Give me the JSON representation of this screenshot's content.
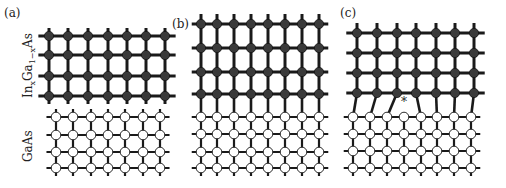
{
  "figure": {
    "panels": [
      {
        "id": "a",
        "label": "(a)"
      },
      {
        "id": "b",
        "label": "(b)"
      },
      {
        "id": "c",
        "label": "(c)"
      }
    ],
    "layer_labels": {
      "top": "InxGa1−xAs",
      "top_parts": {
        "base1": "In",
        "sub1": "x",
        "base2": "Ga",
        "sub2": "1−x",
        "base3": "As"
      },
      "bottom": "GaAs"
    },
    "defect_marker": "*",
    "colors": {
      "filled_atom": "#3a3a3a",
      "bond": "#1a1a1a",
      "open_atom_fill": "#ffffff",
      "open_atom_stroke": "#2a2a2a"
    },
    "lattices": {
      "a": {
        "top": {
          "xs": [
            49,
            68,
            88,
            108,
            127,
            146,
            165
          ],
          "ys": [
            36,
            55,
            76,
            96
          ]
        },
        "bottom": {
          "xs": [
            56,
            73,
            91,
            108,
            125,
            143,
            160
          ],
          "ys": [
            117,
            135,
            152,
            168
          ]
        }
      },
      "b": {
        "top": {
          "xs": [
            201,
            217,
            234,
            251,
            268,
            285,
            302,
            319
          ],
          "ys": [
            24,
            48,
            72,
            94
          ]
        },
        "bottom": {
          "xs": [
            201,
            217,
            234,
            251,
            268,
            285,
            302,
            319
          ],
          "ys": [
            117,
            134,
            152,
            168
          ]
        }
      },
      "c": {
        "top": {
          "xs": [
            357,
            377,
            397,
            416,
            436,
            455,
            474
          ],
          "ys": [
            33,
            53,
            73,
            93
          ]
        },
        "bottom": {
          "xs": [
            353,
            370,
            387,
            404,
            421,
            437,
            454,
            471
          ],
          "ys": [
            117,
            134,
            151,
            168
          ]
        },
        "interface_bonds": [
          [
            0,
            0
          ],
          [
            1,
            1
          ],
          [
            2,
            2
          ],
          [
            3,
            4
          ],
          [
            4,
            5
          ],
          [
            5,
            6
          ],
          [
            6,
            7
          ]
        ],
        "dangling_index": 3,
        "marker_pos": [
          404,
          106
        ]
      }
    }
  }
}
